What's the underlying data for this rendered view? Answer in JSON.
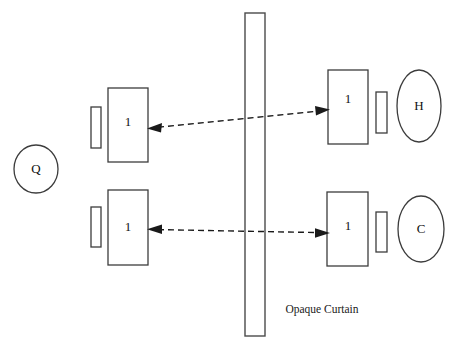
{
  "diagram": {
    "canvas": {
      "width": 461,
      "height": 348,
      "background": "#ffffff"
    },
    "colors": {
      "stroke": "#3c3c3c",
      "curtain_stroke": "#4a4a4a",
      "arrow": "#1a1a1a",
      "text": "#111111",
      "background": "#ffffff"
    },
    "curtain": {
      "label": "Opaque Curtain",
      "x": 245,
      "y": 13,
      "width": 20,
      "height": 323,
      "label_x": 322,
      "label_y": 310
    },
    "sources": [
      {
        "name": "source-q",
        "label": "Q",
        "cx": 36,
        "cy": 169,
        "rx": 22,
        "ry": 24
      },
      {
        "name": "detector-h",
        "label": "H",
        "cx": 419,
        "cy": 106,
        "rx": 22,
        "ry": 36
      },
      {
        "name": "detector-c",
        "label": "C",
        "cx": 421,
        "cy": 229,
        "rx": 23,
        "ry": 33
      }
    ],
    "boxes": [
      {
        "name": "box-upper-left",
        "label": "1",
        "x": 108,
        "y": 88,
        "width": 40,
        "height": 74,
        "label_x": 128,
        "label_y": 122
      },
      {
        "name": "box-upper-right",
        "label": "1",
        "x": 328,
        "y": 70,
        "width": 40,
        "height": 74,
        "label_x": 348,
        "label_y": 99
      },
      {
        "name": "box-lower-left",
        "label": "1",
        "x": 108,
        "y": 190,
        "width": 40,
        "height": 75,
        "label_x": 128,
        "label_y": 227
      },
      {
        "name": "box-lower-right",
        "label": "1",
        "x": 327,
        "y": 192,
        "width": 41,
        "height": 74,
        "label_x": 348,
        "label_y": 226
      }
    ],
    "bars": [
      {
        "name": "bar-upper-left",
        "x": 91,
        "y": 107,
        "width": 10,
        "height": 41
      },
      {
        "name": "bar-upper-right",
        "x": 376,
        "y": 92,
        "width": 11,
        "height": 41
      },
      {
        "name": "bar-lower-left",
        "x": 91,
        "y": 207,
        "width": 10,
        "height": 40
      },
      {
        "name": "bar-lower-right",
        "x": 376,
        "y": 212,
        "width": 11,
        "height": 40
      }
    ],
    "arrows": [
      {
        "name": "arrow-upper",
        "x1": 150,
        "y1": 128,
        "x2": 327,
        "y2": 110,
        "double_headed": true
      },
      {
        "name": "arrow-lower",
        "x1": 150,
        "y1": 229,
        "x2": 327,
        "y2": 233,
        "double_headed": true
      }
    ]
  }
}
